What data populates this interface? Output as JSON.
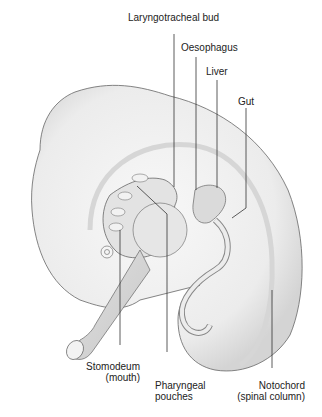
{
  "diagram": {
    "labels": {
      "laryngotracheal_bud": "Laryngotracheal bud",
      "oesophagus": "Oesophagus",
      "liver": "Liver",
      "gut": "Gut",
      "stomodeum_line1": "Stomodeum",
      "stomodeum_line2": "(mouth)",
      "pharyngeal_line1": "Pharyngeal",
      "pharyngeal_line2": "pouches",
      "notochord_line1": "Notochord",
      "notochord_line2": "(spinal column)"
    },
    "colors": {
      "body_fill": "#e9e9e9",
      "body_inner": "#f7f7f7",
      "outline": "#666666",
      "leader": "#333333"
    }
  }
}
